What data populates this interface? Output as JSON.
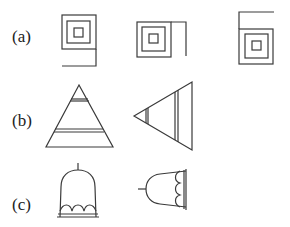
{
  "rows": [
    {
      "label": "(a)",
      "description": "Three variants of nested squares with an open tail line",
      "figures": [
        "nested-squares-tail-bottom",
        "nested-squares-tail-right",
        "nested-squares-tail-top"
      ]
    },
    {
      "label": "(b)",
      "description": "Triangles with two double cross lines",
      "figures": [
        "triangle-upright",
        "triangle-pointing-left"
      ]
    },
    {
      "label": "(c)",
      "description": "Bell shapes with scalloped rim",
      "figures": [
        "bell-upright",
        "bell-pointing-left"
      ]
    }
  ],
  "colors": {
    "stroke": "#3a3a3a",
    "text": "#222222",
    "background": "#ffffff"
  }
}
